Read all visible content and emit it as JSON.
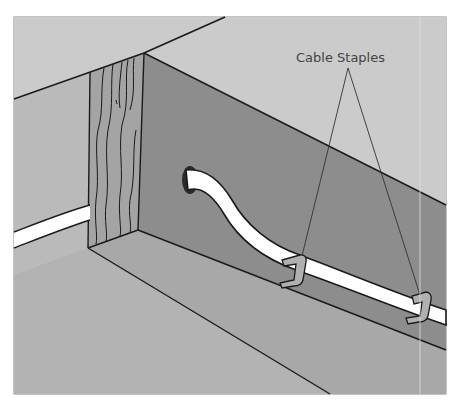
{
  "figure": {
    "annotations": [
      {
        "label": "Cable Staples",
        "targets": 2
      }
    ]
  },
  "colors": {
    "ceiling": "#c9c9c9",
    "wall_left": "#b8b8b8",
    "floor": "#b4b4b4",
    "joist_side": "#8e8e8e",
    "joist_bottom": "#a9a9a9",
    "joist_end": "#a3a3a3",
    "cable": "#ffffff",
    "staple": "#b0b0b0",
    "outline": "#1a1a1a",
    "frame_border": "#8a8a8a"
  }
}
